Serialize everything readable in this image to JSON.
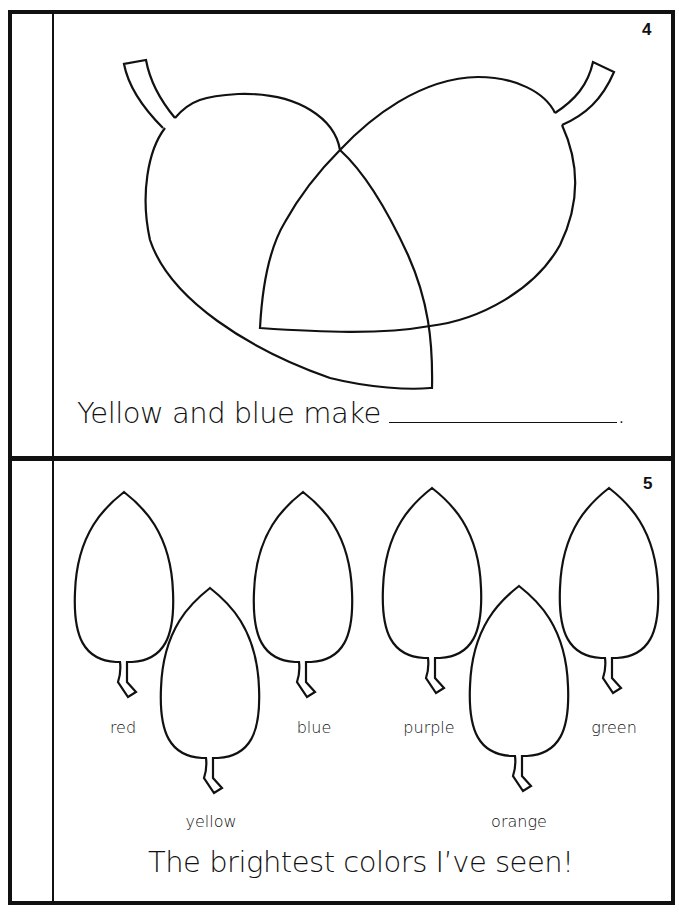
{
  "page4": {
    "page_number": "4",
    "sentence": "Yellow and blue make",
    "blank_terminator": ".",
    "illustration": "two-overlapping-leaves"
  },
  "page5": {
    "page_number": "5",
    "leaves": [
      {
        "label": "red",
        "position": "upper"
      },
      {
        "label": "yellow",
        "position": "lower"
      },
      {
        "label": "blue",
        "position": "upper"
      },
      {
        "label": "purple",
        "position": "upper"
      },
      {
        "label": "orange",
        "position": "lower"
      },
      {
        "label": "green",
        "position": "upper"
      }
    ],
    "caption": "The brightest colors I’ve seen!"
  },
  "colors": {
    "ink": "#111111",
    "paper": "#ffffff"
  }
}
